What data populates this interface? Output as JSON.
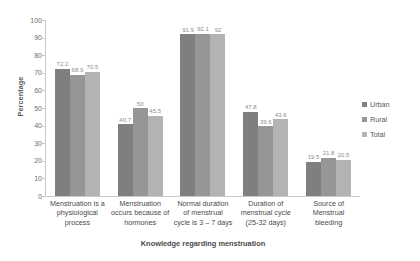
{
  "chart_data": {
    "type": "bar",
    "title": "",
    "xlabel": "Knowledge regarding menstruation",
    "ylabel": "Percentage",
    "ylim": [
      0,
      100
    ],
    "ytick_step": 10,
    "yticks": [
      "100",
      "90",
      "80",
      "70",
      "60",
      "50",
      "40",
      "30",
      "20",
      "10",
      "0"
    ],
    "grid": false,
    "legend_position": "right",
    "categories": [
      "Menstruation is a physiological process",
      "Menstruation occurs because of hormones",
      "Normal duration of menstrual cycle is 3 – 7 days",
      "Duration of menstrual cycle (25-32 days)",
      "Source of Menstrual bleeding"
    ],
    "category_lines": [
      [
        "Menstruation is a",
        "physiological",
        "process"
      ],
      [
        "Menstruation",
        "occurs because of",
        "hormones"
      ],
      [
        "Normal duration",
        "of menstrual",
        "cycle is 3 – 7 days"
      ],
      [
        "Duration of",
        "menstrual cycle",
        "(25-32 days)"
      ],
      [
        "Source of",
        "Menstrual",
        "bleeding"
      ]
    ],
    "series": [
      {
        "name": "Urban",
        "color": "#7f7f7f",
        "values": [
          72.2,
          40.7,
          91.9,
          47.8,
          19.5
        ],
        "labels": [
          "72.2",
          "40.7",
          "91.9",
          "47.8",
          "19.5"
        ]
      },
      {
        "name": "Rural",
        "color": "#969696",
        "values": [
          68.9,
          50,
          92.1,
          39.6,
          21.8
        ],
        "labels": [
          "68.9",
          "50",
          "92.1",
          "39.6",
          "21.8"
        ]
      },
      {
        "name": "Total",
        "color": "#b3b3b3",
        "values": [
          70.5,
          45.5,
          92,
          43.6,
          20.5
        ],
        "labels": [
          "70.5",
          "45.5",
          "92",
          "43.6",
          "20.5"
        ]
      }
    ]
  }
}
